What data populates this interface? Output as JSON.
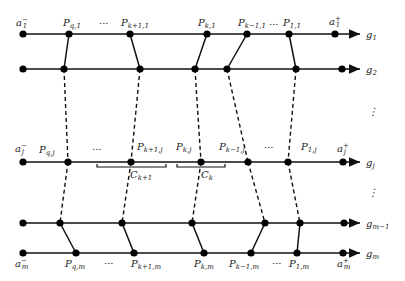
{
  "diagram": {
    "lines": [
      {
        "id": "g1",
        "label": "g",
        "sub": "1",
        "y": 34,
        "left_label": "a",
        "left_sub": "1",
        "left_sup": "−",
        "right_label": "a",
        "right_sub": "1",
        "right_sup": "+"
      },
      {
        "id": "g2",
        "label": "g",
        "sub": "2",
        "y": 69
      },
      {
        "id": "gj",
        "label": "g",
        "sub": "j",
        "y": 162,
        "left_label": "a",
        "left_sub": "j",
        "left_sup": "−",
        "right_label": "a",
        "right_sub": "j",
        "right_sup": "+"
      },
      {
        "id": "gm-1",
        "label": "g",
        "sub": "m−1",
        "y": 223
      },
      {
        "id": "gm",
        "label": "g",
        "sub": "m",
        "y": 253,
        "left_label": "a",
        "left_sub": "m",
        "left_sup": "−",
        "right_label": "a",
        "right_sub": "m",
        "right_sup": "+"
      }
    ],
    "top_points": [
      {
        "label": "P",
        "sub": "q,1"
      },
      {
        "label": "P",
        "sub": "k+1,1"
      },
      {
        "label": "P",
        "sub": "k,1"
      },
      {
        "label": "P",
        "sub": "k−1,1"
      },
      {
        "label": "P",
        "sub": "1,1"
      }
    ],
    "middle_points": [
      {
        "label": "P",
        "sub": "q,j"
      },
      {
        "label": "P",
        "sub": "k+1,j"
      },
      {
        "label": "P",
        "sub": "k,j"
      },
      {
        "label": "P",
        "sub": "k−1,j"
      },
      {
        "label": "P",
        "sub": "1,j"
      }
    ],
    "bottom_points": [
      {
        "label": "P",
        "sub": "q,m"
      },
      {
        "label": "P",
        "sub": "k+1,m"
      },
      {
        "label": "P",
        "sub": "k,m"
      },
      {
        "label": "P",
        "sub": "k−1,m"
      },
      {
        "label": "P",
        "sub": "1,m"
      }
    ],
    "braces": [
      {
        "label": "C",
        "sub": "k+1"
      },
      {
        "label": "C",
        "sub": "k"
      }
    ],
    "ellipsis": "...",
    "vdots": "⋮"
  }
}
